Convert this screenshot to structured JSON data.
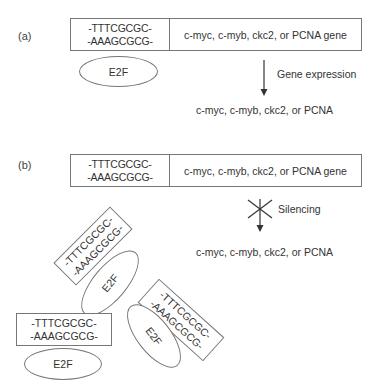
{
  "panel_a": {
    "label": "(a)",
    "gene_box": {
      "seq_top": "-TTTCGCGC-",
      "seq_bottom": "-AAAGCGCG-",
      "gene": "c-myc, c-myb, ckc2, or PCNA gene"
    },
    "e2f": "E2F",
    "arrow_label": "Gene expression",
    "product": "c-myc, c-myb, ckc2, or PCNA"
  },
  "panel_b": {
    "label": "(b)",
    "gene_box": {
      "seq_top": "-TTTCGCGC-",
      "seq_bottom": "-AAAGCGCG-",
      "gene": "c-myc, c-myb, ckc2, or PCNA gene"
    },
    "arrow_label": "Silencing",
    "product": "c-myc, c-myb, ckc2, or PCNA",
    "complexes": [
      {
        "seq_top": "-TTTCGCGC-",
        "seq_bottom": "-AAAGCGCG-",
        "e2f": "E2F"
      },
      {
        "seq_top": "-TTTCGCGC-",
        "seq_bottom": "-AAAGCGCG-",
        "e2f": "E2F"
      },
      {
        "seq_top": "-TTTCGCGC-",
        "seq_bottom": "-AAAGCGCG-",
        "e2f": "E2F"
      }
    ]
  }
}
